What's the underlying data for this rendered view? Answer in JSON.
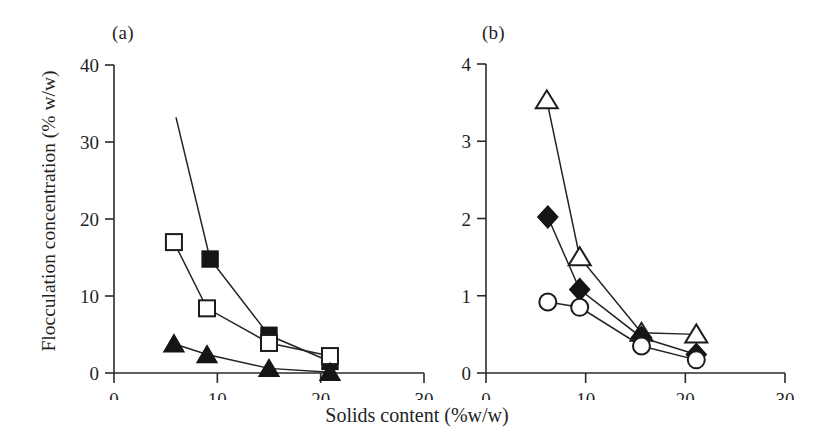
{
  "figure": {
    "xtitle": "Solids content (%w/w)",
    "ytitle": "Flocculation concentration (% w/w)",
    "panel_a_label": "(a)",
    "panel_b_label": "(b)"
  },
  "chart_data": [
    {
      "type": "line",
      "panel": "(a)",
      "title": "",
      "xlabel": "Solids content (%w/w)",
      "ylabel": "Flocculation concentration (% w/w)",
      "xlim": [
        0,
        30
      ],
      "ylim": [
        0,
        40
      ],
      "xticks": [
        0,
        10,
        20,
        30
      ],
      "yticks": [
        0,
        10,
        20,
        30,
        40
      ],
      "xticklabels": [
        "0",
        "10",
        "20",
        "30"
      ],
      "yticklabels": [
        "0",
        "10",
        "20",
        "30",
        "40"
      ],
      "grid": false,
      "legend": "none",
      "series": [
        {
          "name": "filled-square",
          "marker": "filled-square",
          "x": [
            6.0,
            9.3,
            15.0,
            20.9
          ],
          "y": [
            33.2,
            14.8,
            4.9,
            1.5
          ]
        },
        {
          "name": "open-square",
          "marker": "open-square",
          "x": [
            5.8,
            9.0,
            15.0,
            20.9
          ],
          "y": [
            17.0,
            8.4,
            3.9,
            2.2
          ]
        },
        {
          "name": "filled-triangle",
          "marker": "filled-triangle",
          "x": [
            5.8,
            9.0,
            15.0,
            20.9
          ],
          "y": [
            3.8,
            2.4,
            0.6,
            0.1
          ]
        }
      ]
    },
    {
      "type": "line",
      "panel": "(b)",
      "title": "",
      "xlabel": "Solids content (%w/w)",
      "ylabel": "Flocculation concentration (% w/w)",
      "xlim": [
        0,
        30
      ],
      "ylim": [
        0,
        4
      ],
      "xticks": [
        0,
        10,
        20,
        30
      ],
      "yticks": [
        0,
        1,
        2,
        3,
        4
      ],
      "xticklabels": [
        "0",
        "10",
        "20",
        "30"
      ],
      "yticklabels": [
        "0",
        "1",
        "2",
        "3",
        "4"
      ],
      "grid": false,
      "legend": "none",
      "series": [
        {
          "name": "open-triangle",
          "marker": "open-triangle",
          "x": [
            6.1,
            9.4,
            15.6,
            21.1
          ],
          "y": [
            3.53,
            1.5,
            0.52,
            0.5
          ]
        },
        {
          "name": "filled-diamond",
          "marker": "filled-diamond",
          "x": [
            6.2,
            9.4,
            15.6,
            21.1
          ],
          "y": [
            2.02,
            1.08,
            0.46,
            0.24
          ]
        },
        {
          "name": "open-circle",
          "marker": "open-circle",
          "x": [
            6.2,
            9.4,
            15.6,
            21.1
          ],
          "y": [
            0.92,
            0.85,
            0.35,
            0.17
          ]
        }
      ]
    }
  ],
  "axes": {
    "panel_a": {
      "ytick_labels": [
        "40",
        "30",
        "20",
        "10",
        "0"
      ],
      "xtick_labels": [
        "0",
        "10",
        "20",
        "30"
      ]
    },
    "panel_b": {
      "ytick_labels": [
        "4",
        "3",
        "2",
        "1",
        "0"
      ],
      "xtick_labels": [
        "0",
        "10",
        "20",
        "30"
      ]
    }
  }
}
